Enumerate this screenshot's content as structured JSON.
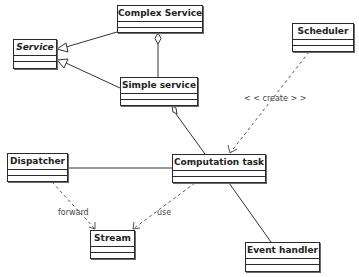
{
  "diagram": {
    "type": "uml-class-diagram",
    "classes": [
      {
        "id": "complex_service",
        "name": "Complex Service",
        "abstract": false
      },
      {
        "id": "service",
        "name": "Service",
        "abstract": true
      },
      {
        "id": "simple_service",
        "name": "Simple service",
        "abstract": false
      },
      {
        "id": "scheduler",
        "name": "Scheduler",
        "abstract": false
      },
      {
        "id": "dispatcher",
        "name": "Dispatcher",
        "abstract": false
      },
      {
        "id": "computation_task",
        "name": "Computation task",
        "abstract": false
      },
      {
        "id": "stream",
        "name": "Stream",
        "abstract": false
      },
      {
        "id": "event_handler",
        "name": "Event handler",
        "abstract": false
      }
    ],
    "relationships": [
      {
        "from": "Complex Service",
        "to": "Service",
        "kind": "generalization",
        "label": ""
      },
      {
        "from": "Simple service",
        "to": "Service",
        "kind": "generalization",
        "label": ""
      },
      {
        "from": "Complex Service",
        "to": "Simple service",
        "kind": "aggregation",
        "label": ""
      },
      {
        "from": "Simple service",
        "to": "Computation task",
        "kind": "aggregation",
        "label": ""
      },
      {
        "from": "Scheduler",
        "to": "Computation task",
        "kind": "dependency",
        "label": "<<create>>"
      },
      {
        "from": "Dispatcher",
        "to": "Computation task",
        "kind": "association",
        "label": ""
      },
      {
        "from": "Dispatcher",
        "to": "Stream",
        "kind": "dependency",
        "label": "forward"
      },
      {
        "from": "Computation task",
        "to": "Stream",
        "kind": "dependency",
        "label": "use"
      },
      {
        "from": "Computation task",
        "to": "Event handler",
        "kind": "association",
        "label": ""
      }
    ]
  },
  "labels": {
    "create": "< < create > >",
    "forward": "forward",
    "use": "use"
  }
}
